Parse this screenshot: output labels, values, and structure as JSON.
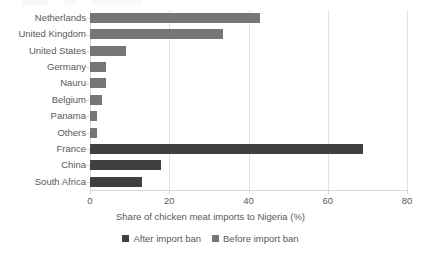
{
  "chart_data": {
    "type": "bar",
    "orientation": "horizontal",
    "title": "",
    "xlabel": "Share of chicken meat imports to Nigeria (%)",
    "ylabel": "",
    "xlim": [
      0,
      80
    ],
    "xticks": [
      0,
      20,
      40,
      60,
      80
    ],
    "grid": true,
    "grid_axis": "x",
    "legend_position": "bottom",
    "categories": [
      "Netherlands",
      "United Kingdom",
      "United States",
      "Germany",
      "Nauru",
      "Belgium",
      "Panama",
      "Others",
      "France",
      "China",
      "South Africa"
    ],
    "series": [
      {
        "name": "After import ban",
        "color": "#404040",
        "values": [
          null,
          null,
          null,
          null,
          null,
          null,
          null,
          null,
          69,
          18,
          13
        ]
      },
      {
        "name": "Before import ban",
        "color": "#767676",
        "values": [
          43,
          33.5,
          9,
          4,
          4,
          3,
          1.7,
          1.7,
          null,
          null,
          null
        ]
      }
    ],
    "bars": [
      {
        "category": "Netherlands",
        "value": 43,
        "series": "Before import ban"
      },
      {
        "category": "United Kingdom",
        "value": 33.5,
        "series": "Before import ban"
      },
      {
        "category": "United States",
        "value": 9,
        "series": "Before import ban"
      },
      {
        "category": "Germany",
        "value": 4,
        "series": "Before import ban"
      },
      {
        "category": "Nauru",
        "value": 4,
        "series": "Before import ban"
      },
      {
        "category": "Belgium",
        "value": 3,
        "series": "Before import ban"
      },
      {
        "category": "Panama",
        "value": 1.7,
        "series": "Before import ban"
      },
      {
        "category": "Others",
        "value": 1.7,
        "series": "Before import ban"
      },
      {
        "category": "France",
        "value": 69,
        "series": "After import ban"
      },
      {
        "category": "China",
        "value": 18,
        "series": "After import ban"
      },
      {
        "category": "South Africa",
        "value": 13,
        "series": "After import ban"
      }
    ]
  },
  "legend": {
    "items": [
      {
        "label": "After import ban",
        "color": "#404040"
      },
      {
        "label": "Before import ban",
        "color": "#767676"
      }
    ]
  },
  "axis": {
    "x_title": "Share of chicken meat imports to Nigeria (%)",
    "x_tick_labels": [
      "0",
      "20",
      "40",
      "60",
      "80"
    ]
  },
  "colors": {
    "after_import_ban": "#404040",
    "before_import_ban": "#767676",
    "gridline": "#e2e2e2",
    "axis": "#d9d9d9",
    "text": "#595959",
    "background": "#ffffff"
  }
}
